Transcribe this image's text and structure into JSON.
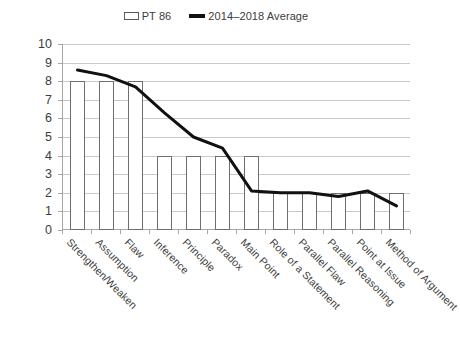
{
  "legend": {
    "entries": [
      {
        "label": "PT 86",
        "type": "bar",
        "color": "#ffffff",
        "border": "#5a5a5a",
        "icon": "white-bar-swatch"
      },
      {
        "label": "2014–2018 Average",
        "type": "line",
        "color": "#111111",
        "icon": "black-line-swatch"
      }
    ]
  },
  "chart_data": {
    "type": "bar",
    "title": "",
    "subtitle": "",
    "xlabel": "",
    "ylabel": "",
    "ylim": [
      0,
      10
    ],
    "ytick_step": 1,
    "yticks": [
      0,
      1,
      2,
      3,
      4,
      5,
      6,
      7,
      8,
      9,
      10
    ],
    "ytick_labels": [
      "0",
      "1",
      "2",
      "3",
      "4",
      "5",
      "6",
      "7",
      "8",
      "9",
      "10"
    ],
    "grid": true,
    "grid_axis": "y",
    "legend_position": "top-center",
    "categories": [
      "Strengthen/Weaken",
      "Assumption",
      "Flaw",
      "Inference",
      "Principle",
      "Paradox",
      "Main Point",
      "Role of a Statement",
      "Parallel Flaw",
      "Parallel Reasoning",
      "Point at Issue",
      "Method of Argument"
    ],
    "series": [
      {
        "name": "PT 86",
        "type": "bar",
        "color": "#ffffff",
        "edge_color": "#6e6e6e",
        "values": [
          8,
          8,
          8,
          4,
          4,
          4,
          4,
          2,
          2,
          2,
          2,
          2
        ]
      },
      {
        "name": "2014–2018 Average",
        "type": "line",
        "color": "#111111",
        "line_width": 3,
        "values": [
          8.6,
          8.3,
          7.7,
          6.3,
          5.0,
          4.4,
          2.1,
          2.0,
          2.0,
          1.8,
          2.1,
          1.3
        ]
      }
    ],
    "annotations": []
  }
}
